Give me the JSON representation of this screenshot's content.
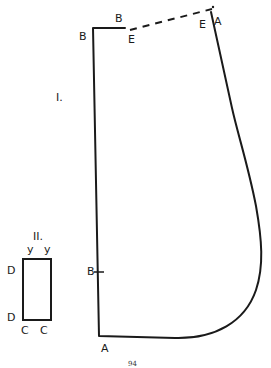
{
  "figure": {
    "main_pattern": {
      "numeral": "I.",
      "labels": {
        "top_left_B": "B",
        "top_B": "B",
        "dashed_start_E": "E",
        "dashed_end_E": "E",
        "top_right_A": "A",
        "side_B": "B",
        "bottom_A": "A"
      }
    },
    "small_pattern": {
      "numeral": "II.",
      "labels": {
        "top_left_y": "y",
        "top_right_y": "y",
        "upper_D": "D",
        "lower_D": "D",
        "bottom_left_C": "C",
        "bottom_right_C": "C"
      }
    },
    "page_number": "94"
  },
  "colors": {
    "ink": "#1a1a1a",
    "paper": "#ffffff"
  }
}
